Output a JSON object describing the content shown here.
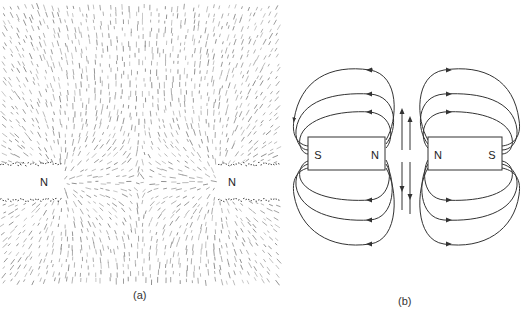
{
  "panel_a": {
    "caption": "(a)",
    "description": "Iron filings pattern between two like (N-N) magnet poles",
    "left_pole_label": "N",
    "right_pole_label": "N"
  },
  "panel_b": {
    "caption": "(b)",
    "description": "Field lines between two bar magnets with facing north poles",
    "left_magnet": {
      "left_label": "S",
      "right_label": "N"
    },
    "right_magnet": {
      "left_label": "N",
      "right_label": "S"
    }
  },
  "colors": {
    "line": "#333333",
    "filings": "#888888",
    "background": "#ffffff"
  }
}
